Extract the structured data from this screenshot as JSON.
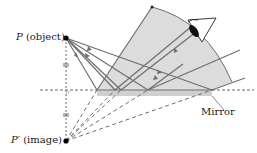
{
  "diagram": {
    "labels": {
      "object_symbol": "P",
      "object_text": "(object)",
      "image_symbol": "P′",
      "image_text": "(image)",
      "mirror": "Mirror"
    },
    "colors": {
      "ray": "#6e6e6e",
      "shade": "#dcdcdc",
      "mirror_fill": "#cfcfcf",
      "dashed": "#444444",
      "point": "#000000"
    },
    "points": {
      "object": {
        "x": 66,
        "y": 38
      },
      "image": {
        "x": 66,
        "y": 141
      },
      "eye": {
        "x": 196,
        "y": 22
      }
    },
    "mirror_line_y": 90,
    "equal_distance_marks": "=",
    "rays_count": 5
  }
}
